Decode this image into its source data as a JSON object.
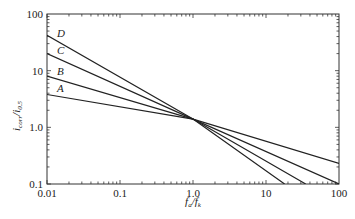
{
  "chart_data": {
    "type": "line",
    "title": "",
    "xlabel": "f_a/f_k",
    "ylabel": "i_corr/i_0.5",
    "xscale": "log",
    "yscale": "log",
    "xlim": [
      0.01,
      100
    ],
    "ylim": [
      0.1,
      100
    ],
    "grid": false,
    "legend": "inline labels near left ends of lines",
    "x_ticks": [
      "0.01",
      "0.1",
      "1.0",
      "10",
      "100"
    ],
    "y_ticks": [
      "100",
      "10",
      "1.0",
      "0.1"
    ],
    "series": [
      {
        "name": "A",
        "x": [
          0.01,
          1.0,
          100
        ],
        "values": [
          3.8,
          1.4,
          0.23
        ]
      },
      {
        "name": "B",
        "x": [
          0.01,
          1.0,
          100
        ],
        "values": [
          8.0,
          1.4,
          0.1
        ]
      },
      {
        "name": "C",
        "x": [
          0.01,
          1.0,
          35
        ],
        "values": [
          20,
          1.4,
          0.1
        ]
      },
      {
        "name": "D",
        "x": [
          0.01,
          1.0,
          18
        ],
        "values": [
          42,
          1.4,
          0.1
        ]
      }
    ]
  },
  "labels": {
    "x_axis_title_main": "f",
    "x_axis_title_sub1": "a",
    "x_axis_title_mid": "/f",
    "x_axis_title_sub2": "k",
    "y_axis_title_main": "i",
    "y_axis_title_sub1": "corr",
    "y_axis_title_mid": "/i",
    "y_axis_title_sub2": "0.5"
  }
}
